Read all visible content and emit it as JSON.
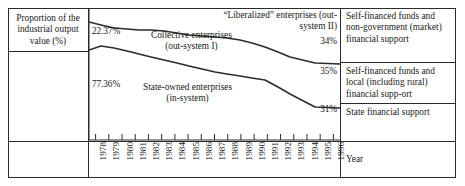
{
  "chart_data": {
    "type": "area",
    "title": "",
    "xlabel": "Year",
    "ylabel": "Proportion of the industrial output value (%)",
    "ylim": [
      0,
      100
    ],
    "grid": false,
    "legend": "inline-annotations",
    "x": [
      1978,
      1979,
      1980,
      1981,
      1982,
      1983,
      1984,
      1985,
      1986,
      1987,
      1988,
      1989,
      1990,
      1991,
      1992,
      1993,
      1994,
      1995,
      1996
    ],
    "tick_labels": [
      "1978",
      "1979",
      "1980",
      "1981",
      "1982",
      "1983",
      "1984",
      "1985",
      "1986",
      "1987",
      "1988",
      "1989",
      "1990",
      "1991",
      "1992",
      "1993",
      "1994",
      "1995",
      "1996"
    ],
    "series": [
      {
        "name": "“Liberalized” enterprises (out-system II)",
        "boundary": "upper",
        "start_value": 0.27,
        "end_value": 34,
        "end_label": "34%"
      },
      {
        "name": "Collective enterprises (out-system I)",
        "boundary": "middle",
        "start_value": 22.37,
        "end_value": 35,
        "start_label": "22.37%",
        "end_label": "35%"
      },
      {
        "name": "State-owned enterprises (in-system)",
        "boundary": "lower",
        "start_value": 77.36,
        "end_value": 31,
        "start_label": "77.36%",
        "end_label": "31%"
      }
    ],
    "upper_boundary_points": [
      [
        0,
        14
      ],
      [
        12,
        17
      ],
      [
        25,
        20
      ],
      [
        38,
        21
      ],
      [
        50,
        22
      ],
      [
        62,
        22
      ],
      [
        75,
        23
      ],
      [
        88,
        25
      ],
      [
        100,
        27
      ],
      [
        113,
        28
      ],
      [
        126,
        29
      ],
      [
        138,
        30
      ],
      [
        151,
        32
      ],
      [
        163,
        35
      ],
      [
        176,
        39
      ],
      [
        189,
        44
      ],
      [
        201,
        49
      ],
      [
        226,
        55
      ],
      [
        251,
        56
      ]
    ],
    "lower_boundary_points": [
      [
        0,
        42
      ],
      [
        12,
        38
      ],
      [
        25,
        40
      ],
      [
        38,
        43
      ],
      [
        50,
        46
      ],
      [
        62,
        49
      ],
      [
        75,
        52
      ],
      [
        88,
        55
      ],
      [
        100,
        58
      ],
      [
        113,
        61
      ],
      [
        126,
        64
      ],
      [
        138,
        66
      ],
      [
        151,
        68
      ],
      [
        163,
        70
      ],
      [
        176,
        72
      ],
      [
        189,
        79
      ],
      [
        201,
        86
      ],
      [
        226,
        99
      ],
      [
        251,
        100
      ]
    ]
  },
  "left_panel": {
    "axis_label": "Proportion of the industrial output value (%)"
  },
  "plot_annotations": {
    "liberalized_line1": "“Liberalized” enterprises (out-",
    "liberalized_line2": "system II)",
    "collective_line1": "Collective enterprises",
    "collective_line2": "(out-system I)",
    "soe_line1": "State-owned enterprises",
    "soe_line2": "(in-system)",
    "pct_top_left": "22.37%",
    "pct_bottom_left": "77.36%",
    "pct_right_1": "34%",
    "pct_right_2": "35%",
    "pct_right_3": "31%"
  },
  "right_panel": {
    "boxes": [
      "Self-financed funds and non-government (market) financial support",
      "Self-financed funds and local (including rural) financial supp-ort",
      "State financial support"
    ],
    "year_label": "Year"
  },
  "colors": {
    "line": "#2b2b2b",
    "border": "#2b2b2b",
    "text": "#1a1a1a",
    "background": "#ffffff"
  }
}
